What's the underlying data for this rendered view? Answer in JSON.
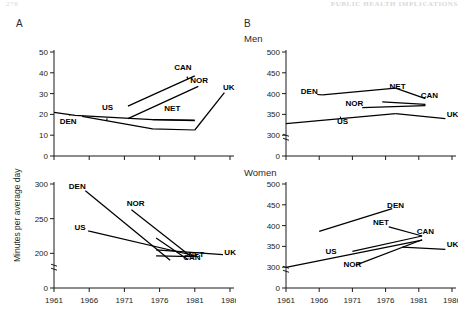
{
  "running_head": {
    "left": "278",
    "right": "PUBLIC HEALTH IMPLICATIONS"
  },
  "panels": {
    "a": {
      "letter": "A",
      "title": ""
    },
    "b": {
      "letter": "B",
      "title_top": "Men",
      "title_bottom": "Women"
    }
  },
  "axis_label_y": "Minutes per average day",
  "x_ticks": [
    "1961",
    "1966",
    "1971",
    "1976",
    "1981",
    "1986"
  ],
  "series_labels": [
    "DEN",
    "US",
    "CAN",
    "NOR",
    "NET",
    "UK"
  ],
  "chart_data": [
    {
      "id": "a-top",
      "type": "line",
      "title": "",
      "panel": "A",
      "xlabel": "",
      "ylabel": "Minutes per average day",
      "xlim": [
        1961,
        1986
      ],
      "ylim": [
        0,
        50
      ],
      "yticks": [
        0,
        10,
        20,
        30,
        40,
        50
      ],
      "xticks": [
        1961,
        1966,
        1971,
        1976,
        1981,
        1986
      ],
      "grid": false,
      "legend": "direct-labels",
      "axis_break": false,
      "series": [
        {
          "name": "DEN",
          "x": [
            1961,
            1964,
            1975,
            1981
          ],
          "y": [
            21.0,
            19.5,
            17.5,
            17.0
          ],
          "label_x": 1963.0,
          "label_y": 15.6
        },
        {
          "name": "US",
          "x": [
            1965,
            1975,
            1981
          ],
          "y": [
            19.0,
            13.0,
            12.5
          ],
          "label_x": 1968.6,
          "label_y": 22.0
        },
        {
          "name": "CAN",
          "x": [
            1971.5,
            1981
          ],
          "y": [
            24.0,
            38.5
          ],
          "label_x": 1979.3,
          "label_y": 41.5
        },
        {
          "name": "NOR",
          "x": [
            1971.5,
            1981.5
          ],
          "y": [
            18.0,
            33.5
          ],
          "label_x": 1981.6,
          "label_y": 35.0
        },
        {
          "name": "NET",
          "x": [
            1975,
            1981
          ],
          "y": [
            17.5,
            17.2
          ],
          "label_x": 1977.8,
          "label_y": 21.5
        },
        {
          "name": "UK",
          "x": [
            1981,
            1985.2
          ],
          "y": [
            12.5,
            30.5
          ],
          "label_x": 1985.0,
          "label_y": 31.5
        }
      ]
    },
    {
      "id": "a-bottom",
      "type": "line",
      "title": "",
      "panel": "A",
      "xlabel": "",
      "ylabel": "Minutes per average day",
      "xlim": [
        1961,
        1986
      ],
      "ylim": [
        0,
        300
      ],
      "yticks": [
        0,
        200,
        250,
        300
      ],
      "xticks": [
        1961,
        1966,
        1971,
        1976,
        1981,
        1986
      ],
      "grid": false,
      "legend": "direct-labels",
      "axis_break": true,
      "series": [
        {
          "name": "DEN",
          "x": [
            1965.5,
            1977.5
          ],
          "y": [
            290.0,
            160.0
          ],
          "label_x": 1964.3,
          "label_y": 293.0
        },
        {
          "name": "US",
          "x": [
            1966.0,
            1981.0
          ],
          "y": [
            232.0,
            186.0
          ],
          "label_x": 1964.7,
          "label_y": 234.0
        },
        {
          "name": "NOR",
          "x": [
            1972.0,
            1980.5
          ],
          "y": [
            263.0,
            180.0
          ],
          "label_x": 1972.6,
          "label_y": 268.0
        },
        {
          "name": "NET",
          "x": [
            1975.5,
            1981.0
          ],
          "y": [
            186.0,
            180.5
          ],
          "label_x": 1981.2,
          "label_y": 176.0
        },
        {
          "name": "CAN",
          "x": [
            1975.5,
            1980.0
          ],
          "y": [
            222.0,
            165.0
          ],
          "label_x": 1980.6,
          "label_y": 162.0
        },
        {
          "name": "UK",
          "x": [
            1975.5,
            1985.0
          ],
          "y": [
            205.0,
            192.0
          ],
          "label_x": 1985.2,
          "label_y": 192.0
        }
      ]
    },
    {
      "id": "b-men",
      "type": "line",
      "title": "Men",
      "panel": "B",
      "xlabel": "",
      "ylabel": "",
      "xlim": [
        1961,
        1986
      ],
      "ylim": [
        0,
        500
      ],
      "yticks": [
        0,
        300,
        350,
        400,
        450,
        500
      ],
      "xticks": [
        1961,
        1966,
        1971,
        1976,
        1981,
        1986
      ],
      "grid": false,
      "legend": "direct-labels",
      "axis_break": true,
      "series": [
        {
          "name": "DEN",
          "x": [
            1966.5,
            1977.5
          ],
          "y": [
            397.0,
            413.0
          ],
          "label_x": 1964.5,
          "label_y": 399.0
        },
        {
          "name": "NET",
          "x": [
            1977.5,
            1982.0
          ],
          "y": [
            413.0,
            388.0
          ],
          "label_x": 1977.8,
          "label_y": 410.0
        },
        {
          "name": "NOR",
          "x": [
            1972.5,
            1982.0
          ],
          "y": [
            366.0,
            371.0
          ],
          "label_x": 1971.3,
          "label_y": 371.0
        },
        {
          "name": "CAN",
          "x": [
            1975.5,
            1982.0
          ],
          "y": [
            380.0,
            374.0
          ],
          "label_x": 1982.6,
          "label_y": 390.0
        },
        {
          "name": "US",
          "x": [
            1961.0,
            1977.5
          ],
          "y": [
            328.0,
            352.0
          ],
          "label_x": 1969.5,
          "label_y": 326.0
        },
        {
          "name": "UK",
          "x": [
            1977.5,
            1985.0
          ],
          "y": [
            352.0,
            340.0
          ],
          "label_x": 1985.2,
          "label_y": 343.0
        }
      ]
    },
    {
      "id": "b-women",
      "type": "line",
      "title": "Women",
      "panel": "B",
      "xlabel": "",
      "ylabel": "",
      "xlim": [
        1961,
        1986
      ],
      "ylim": [
        0,
        500
      ],
      "yticks": [
        0,
        300,
        350,
        400,
        450,
        500
      ],
      "xticks": [
        1961,
        1966,
        1971,
        1976,
        1981,
        1986
      ],
      "grid": false,
      "legend": "direct-labels",
      "axis_break": true,
      "series": [
        {
          "name": "DEN",
          "x": [
            1966.0,
            1977.0
          ],
          "y": [
            386.0,
            441.0
          ],
          "label_x": 1977.5,
          "label_y": 443.0
        },
        {
          "name": "NET",
          "x": [
            1976.5,
            1981.5
          ],
          "y": [
            397.0,
            375.0
          ],
          "label_x": 1975.3,
          "label_y": 402.0
        },
        {
          "name": "CAN",
          "x": [
            1971.0,
            1981.5
          ],
          "y": [
            338.0,
            375.0
          ],
          "label_x": 1982.0,
          "label_y": 381.0
        },
        {
          "name": "US",
          "x": [
            1961.0,
            1981.5
          ],
          "y": [
            298.0,
            365.0
          ],
          "label_x": 1967.8,
          "label_y": 332.0
        },
        {
          "name": "NOR",
          "x": [
            1971.5,
            1981.5
          ],
          "y": [
            305.0,
            366.0
          ],
          "label_x": 1971.0,
          "label_y": 300.0
        },
        {
          "name": "UK",
          "x": [
            1978.5,
            1985.0
          ],
          "y": [
            348.0,
            343.0
          ],
          "label_x": 1985.2,
          "label_y": 348.0
        }
      ]
    }
  ]
}
